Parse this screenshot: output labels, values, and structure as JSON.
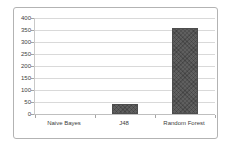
{
  "chart_data": {
    "type": "bar",
    "title": "",
    "xlabel": "",
    "ylabel": "",
    "categories": [
      "Naive Bayes",
      "J48",
      "Random Forest"
    ],
    "values": [
      2,
      40,
      360
    ],
    "ylim": [
      0,
      400
    ],
    "yticks": [
      0,
      50,
      100,
      150,
      200,
      250,
      300,
      350,
      400
    ],
    "grid": true,
    "legend": "none",
    "colors": {
      "bar_fill": "#5f5f5f",
      "bar_border": "#4d4d4d",
      "gridline": "#d9d9d9",
      "frame_border": "#b3b3b3",
      "axis_text": "#404040",
      "background": "#ffffff"
    }
  }
}
